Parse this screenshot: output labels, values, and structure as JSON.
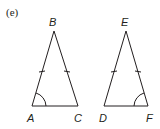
{
  "figure": {
    "part_label": "(e)",
    "triangles": [
      {
        "name": "triangle-ABC",
        "vertices": {
          "A": "A",
          "B": "B",
          "C": "C"
        },
        "marked_equal_sides": [
          "AB",
          "BC"
        ],
        "marked_angle": "A"
      },
      {
        "name": "triangle-DEF",
        "vertices": {
          "D": "D",
          "E": "E",
          "F": "F"
        },
        "marked_equal_sides": [
          "DE",
          "EF"
        ],
        "marked_angle": "F"
      }
    ]
  }
}
